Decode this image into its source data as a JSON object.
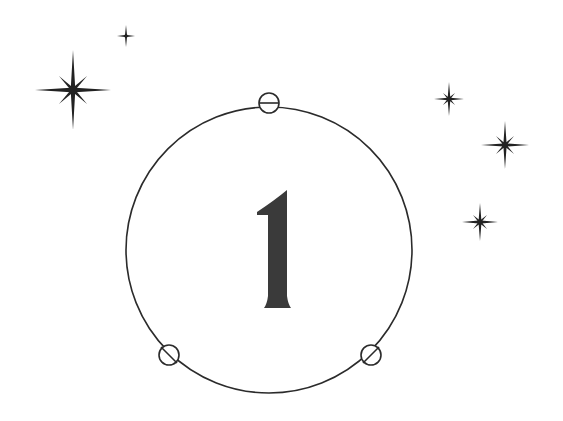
{
  "illustration": {
    "numeral": "1",
    "ink_color": "#2b2b2b",
    "numeral_color": "#3a3a3a",
    "background": "#ffffff",
    "ring": {
      "cx": 269,
      "cy": 250,
      "r": 143
    },
    "ring_nodes": [
      {
        "cx": 269,
        "cy": 103,
        "r": 10
      },
      {
        "cx": 169,
        "cy": 355,
        "r": 10
      },
      {
        "cx": 371,
        "cy": 355,
        "r": 10
      }
    ],
    "stars": [
      {
        "cx": 73,
        "cy": 90,
        "size": 36
      },
      {
        "cx": 126,
        "cy": 36,
        "size": 10
      },
      {
        "cx": 449,
        "cy": 99,
        "size": 16
      },
      {
        "cx": 505,
        "cy": 145,
        "size": 24
      },
      {
        "cx": 480,
        "cy": 222,
        "size": 18
      }
    ]
  }
}
